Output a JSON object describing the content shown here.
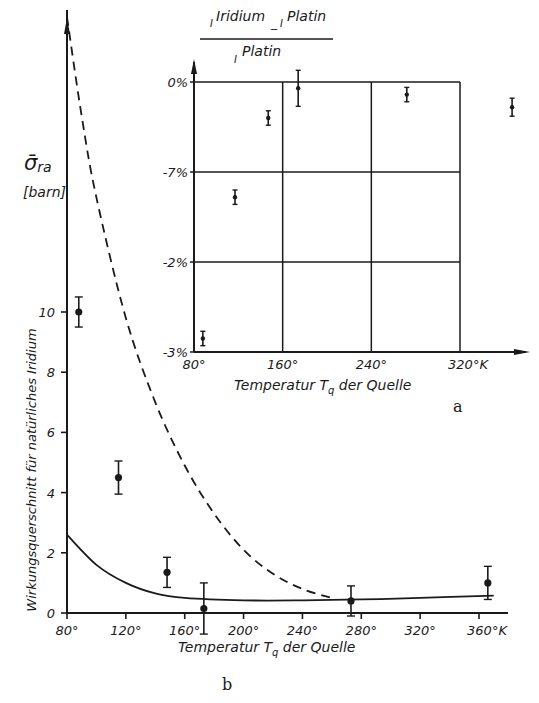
{
  "chart_data": [
    {
      "id": "b",
      "type": "scatter",
      "panel_label": "b",
      "title": "",
      "ylabel_symbol": "σ̄ra",
      "ylabel_unit": "[barn]",
      "ylabel": "Wirkungsquerschnitt für natürliches Iridium",
      "xlabel": "Temperatur Tq der Quelle",
      "x_unit": "°K",
      "xlim": [
        80,
        380
      ],
      "ylim": [
        0,
        20
      ],
      "x_ticks": [
        "80°",
        "120°",
        "160°",
        "200°",
        "240°",
        "280°",
        "320°",
        "360°K"
      ],
      "x_tick_values": [
        80,
        120,
        160,
        200,
        240,
        280,
        320,
        360
      ],
      "y_ticks": [
        "0",
        "2",
        "4",
        "6",
        "8",
        "10"
      ],
      "y_tick_values": [
        0,
        2,
        4,
        6,
        8,
        10
      ],
      "grid": false,
      "series": [
        {
          "name": "Messpunkte",
          "style": "points-with-errorbars",
          "points": [
            {
              "x": 88,
              "y": 10.0,
              "err": 0.5
            },
            {
              "x": 115,
              "y": 4.5,
              "err": 0.55
            },
            {
              "x": 148,
              "y": 1.35,
              "err": 0.5
            },
            {
              "x": 173,
              "y": 0.15,
              "err": 0.85
            },
            {
              "x": 273,
              "y": 0.4,
              "err": 0.5
            },
            {
              "x": 366,
              "y": 1.0,
              "err": 0.55
            }
          ]
        },
        {
          "name": "Theorie (durchgezogen)",
          "style": "solid",
          "x": [
            80,
            100,
            120,
            140,
            160,
            200,
            240,
            280,
            320,
            370
          ],
          "y": [
            2.6,
            1.6,
            1.0,
            0.65,
            0.5,
            0.42,
            0.42,
            0.45,
            0.5,
            0.58
          ]
        },
        {
          "name": "Theorie (gestrichelt)",
          "style": "dashed",
          "x": [
            80,
            90,
            100,
            120,
            140,
            160,
            180,
            200,
            220,
            240,
            260
          ],
          "y": [
            19.8,
            16.5,
            13.8,
            9.8,
            7.0,
            4.9,
            3.3,
            2.1,
            1.3,
            0.8,
            0.5
          ]
        }
      ]
    },
    {
      "id": "a",
      "type": "scatter",
      "panel_label": "a",
      "title": "",
      "ylabel": "(I^Iridium − I^Platin) / I^Platin",
      "ylabel_parts": {
        "num_a": "I",
        "num_a_sup": "Iridium",
        "minus": "_",
        "num_b": "I",
        "num_b_sup": "Platin",
        "den": "I",
        "den_sup": "Platin"
      },
      "xlabel": "Temperatur Tq der Quelle",
      "x_unit": "°K",
      "xlim": [
        80,
        320
      ],
      "ylim": [
        -3,
        0
      ],
      "x_ticks": [
        "80°",
        "160°",
        "240°",
        "320°K"
      ],
      "x_tick_values": [
        80,
        160,
        240,
        320
      ],
      "y_ticks": [
        "0%",
        "-7%",
        "-2%",
        "-3%"
      ],
      "y_tick_values": [
        0,
        -1,
        -2,
        -3
      ],
      "grid": true,
      "series": [
        {
          "name": "Messpunkte",
          "style": "points-with-errorbars",
          "points": [
            {
              "x": 88,
              "y": -2.85,
              "err": 0.08
            },
            {
              "x": 117,
              "y": -1.28,
              "err": 0.08
            },
            {
              "x": 147,
              "y": -0.4,
              "err": 0.08
            },
            {
              "x": 174,
              "y": -0.07,
              "err": 0.2
            },
            {
              "x": 272,
              "y": -0.14,
              "err": 0.08
            },
            {
              "x": 367,
              "y": -0.28,
              "err": 0.1
            }
          ]
        }
      ]
    }
  ],
  "labels": {
    "main_ylabel_symbol": "σ̄",
    "main_ylabel_sub": "ra",
    "main_ylabel_unit": "[barn]",
    "main_ylabel_long": "Wirkungsquerschnitt für natürliches Iridium",
    "main_xlabel_pre": "Temperatur T",
    "main_xlabel_sub": "q",
    "main_xlabel_post": " der Quelle",
    "main_panel": "b",
    "inset_xlabel_pre": "Temperatur T",
    "inset_xlabel_sub": "q",
    "inset_xlabel_post": " der Quelle",
    "inset_panel": "a",
    "inset_num_i1": "I",
    "inset_num_sup1": "Iridium",
    "inset_num_minus": "_",
    "inset_num_i2": "I",
    "inset_num_sup2": "Platin",
    "inset_den_i": "I",
    "inset_den_sup": "Platin"
  },
  "colors": {
    "ink": "#1a1a1a",
    "background": "#ffffff"
  }
}
